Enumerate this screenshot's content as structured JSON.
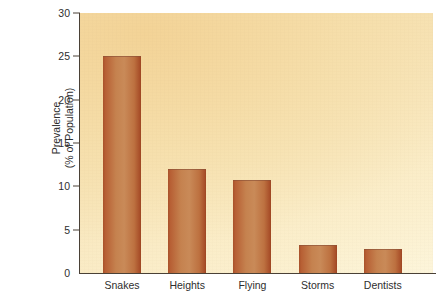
{
  "chart_data": {
    "type": "bar",
    "title": "",
    "subtitle": "",
    "xlabel": "",
    "ylabel_line1": "Prevalence",
    "ylabel_line2": "(% of Population)",
    "categories": [
      "Snakes",
      "Heights",
      "Flying",
      "Storms",
      "Dentists"
    ],
    "values": [
      25,
      12,
      10.7,
      3.2,
      2.8
    ],
    "ylim": [
      0,
      30
    ],
    "ytick_values": [
      0,
      5,
      10,
      15,
      20,
      25,
      30
    ],
    "ytick_labels": [
      "0",
      "5",
      "10",
      "15",
      "20",
      "25",
      "30"
    ],
    "grid": false,
    "legend": "none",
    "bar_color": "#c07a46",
    "bar_edge_color": "#a8512a",
    "plot_background_color": "#f4dca8",
    "axis_color": "#4a4136",
    "text_color": "#2e2e2e"
  }
}
